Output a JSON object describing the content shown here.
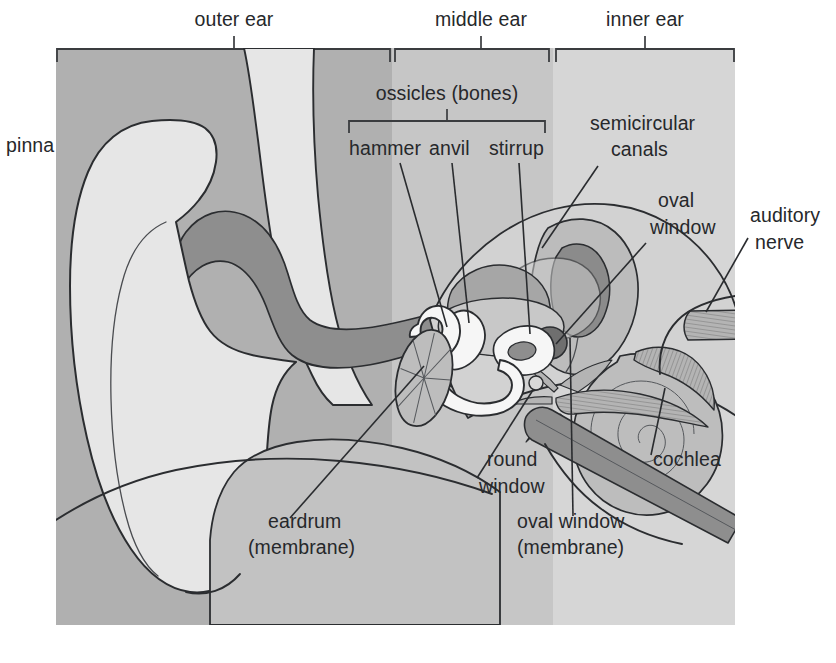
{
  "figure": {
    "kind": "anatomical-diagram",
    "width": 836,
    "height": 663
  },
  "regions": {
    "outer": {
      "label": "outer ear",
      "label_x": 234,
      "label_y": 26,
      "tick_x": 234,
      "band_x0": 56,
      "band_x1": 392,
      "color": "#b0b0b0"
    },
    "middle": {
      "label": "middle ear",
      "label_x": 481,
      "label_y": 26,
      "tick_x": 481,
      "band_x0": 392,
      "band_x1": 553,
      "color": "#c6c6c6"
    },
    "inner": {
      "label": "inner ear",
      "label_x": 645,
      "label_y": 26,
      "tick_x": 645,
      "band_x0": 553,
      "band_x1": 735,
      "color": "#d6d6d6"
    }
  },
  "ossicles_group": {
    "label": "ossicles (bones)",
    "label_x": 447,
    "label_y": 100,
    "stem_x": 447,
    "bracket_left_x": 349,
    "bracket_right_x": 545,
    "bracket_y": 121,
    "bracket_drop": 12
  },
  "labels": [
    {
      "key": "pinna",
      "text": "pinna",
      "x": 6,
      "y": 152,
      "anchor": "start",
      "interactable": false
    },
    {
      "key": "hammer",
      "text": "hammer",
      "x": 349,
      "y": 155,
      "anchor": "start",
      "interactable": false
    },
    {
      "key": "anvil",
      "text": "anvil",
      "x": 429,
      "y": 155,
      "anchor": "start",
      "interactable": false
    },
    {
      "key": "stirrup",
      "text": "stirrup",
      "x": 489,
      "y": 155,
      "anchor": "start",
      "interactable": false
    },
    {
      "key": "semicircular-canals-1",
      "text": "semicircular",
      "x": 590,
      "y": 130,
      "anchor": "start",
      "interactable": false
    },
    {
      "key": "semicircular-canals-2",
      "text": "canals",
      "x": 611,
      "y": 156,
      "anchor": "start",
      "interactable": false
    },
    {
      "key": "oval-window-top-1",
      "text": "oval",
      "x": 658,
      "y": 207,
      "anchor": "start",
      "interactable": false
    },
    {
      "key": "oval-window-top-2",
      "text": "window",
      "x": 650,
      "y": 234,
      "anchor": "start",
      "interactable": false
    },
    {
      "key": "auditory-nerve-1",
      "text": "auditory",
      "x": 750,
      "y": 222,
      "anchor": "start",
      "interactable": false
    },
    {
      "key": "auditory-nerve-2",
      "text": "nerve",
      "x": 755,
      "y": 249,
      "anchor": "start",
      "interactable": false
    },
    {
      "key": "cochlea",
      "text": "cochlea",
      "x": 653,
      "y": 466,
      "anchor": "start",
      "interactable": false
    },
    {
      "key": "round-window-1",
      "text": "round",
      "x": 487,
      "y": 466,
      "anchor": "start",
      "interactable": false
    },
    {
      "key": "round-window-2",
      "text": "window",
      "x": 479,
      "y": 493,
      "anchor": "start",
      "interactable": false
    },
    {
      "key": "eardrum-1",
      "text": "eardrum",
      "x": 268,
      "y": 528,
      "anchor": "start",
      "interactable": false
    },
    {
      "key": "eardrum-2",
      "text": "(membrane)",
      "x": 248,
      "y": 554,
      "anchor": "start",
      "interactable": false
    },
    {
      "key": "oval-window-bottom-1",
      "text": "oval window",
      "x": 517,
      "y": 528,
      "anchor": "start",
      "interactable": false
    },
    {
      "key": "oval-window-bottom-2",
      "text": "(membrane)",
      "x": 517,
      "y": 554,
      "anchor": "start",
      "interactable": false
    }
  ],
  "leaders": [
    {
      "key": "hammer-leader",
      "d": "M 400 163 L 447 327"
    },
    {
      "key": "anvil-leader",
      "d": "M 452 163 L 469 323"
    },
    {
      "key": "stirrup-leader",
      "d": "M 519 163 L 530 334"
    },
    {
      "key": "semicircular-leader",
      "d": "M 598 166 L 564 240"
    },
    {
      "key": "oval-window-top-leader",
      "d": "M 646 243 L 553 342"
    },
    {
      "key": "auditory-nerve-leader",
      "d": "M 748 238 L 712 312"
    },
    {
      "key": "cochlea-leader",
      "d": "M 651 455 L 665 390"
    },
    {
      "key": "round-window-leader",
      "d": "M 477 478 L 536 386"
    },
    {
      "key": "eardrum-leader",
      "d": "M 290 518 L 422 369"
    },
    {
      "key": "oval-window-bottom-leader",
      "d": "M 573 516 L 570 338"
    }
  ],
  "palette": {
    "band_outer": "#b0b0b0",
    "band_middle": "#c6c6c6",
    "band_inner": "#d6d6d6",
    "cartilage_light": "#e4e4e4",
    "canal_dark": "#8b8b8b",
    "tissue_mid": "#bdbdbd",
    "bone_white": "#f4f4f4",
    "structure_gray": "#a8a8a8",
    "accent_dark": "#7e7e7e",
    "outline": "#2b2d30",
    "text": "#26282b"
  },
  "structures": [
    {
      "key": "pinna-outer",
      "name": "pinna outer cartilage"
    },
    {
      "key": "pinna-inner",
      "name": "pinna inner fold"
    },
    {
      "key": "ear-canal",
      "name": "ear canal (auditory canal)"
    },
    {
      "key": "eardrum",
      "name": "eardrum membrane"
    },
    {
      "key": "hammer-bone",
      "name": "hammer (malleus)"
    },
    {
      "key": "anvil-bone",
      "name": "anvil (incus)"
    },
    {
      "key": "stirrup-bone",
      "name": "stirrup (stapes)"
    },
    {
      "key": "semicircular-canals",
      "name": "semicircular canals"
    },
    {
      "key": "cochlea",
      "name": "cochlea spiral"
    },
    {
      "key": "auditory-nerve",
      "name": "auditory nerve"
    },
    {
      "key": "eustachian-tube",
      "name": "eustachian tube"
    },
    {
      "key": "oval-window",
      "name": "oval window"
    },
    {
      "key": "round-window",
      "name": "round window"
    }
  ]
}
